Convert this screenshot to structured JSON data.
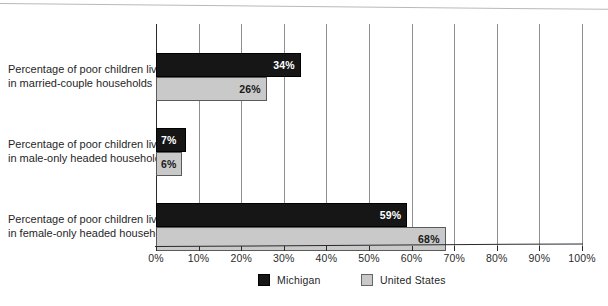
{
  "chart_data": {
    "type": "bar",
    "orientation": "horizontal",
    "title": "",
    "xlabel": "",
    "ylabel": "",
    "xlim": [
      0,
      100
    ],
    "grid": true,
    "legend_position": "bottom",
    "categories": [
      "Percentage of poor children living in married-couple households",
      "Percentage of poor children living in male-only headed households",
      "Percentage of poor children living in female-only headed households"
    ],
    "category_lines": [
      [
        "Percentage of poor children living",
        "in married-couple households"
      ],
      [
        "Percentage of poor children living",
        "in male-only headed households"
      ],
      [
        "Percentage of poor children living",
        "in female-only headed households"
      ]
    ],
    "series": [
      {
        "name": "Michigan",
        "color": "#161616",
        "values": [
          34,
          7,
          59
        ],
        "labels": [
          "34%",
          "7%",
          "59%"
        ]
      },
      {
        "name": "United States",
        "color": "#c9c9c9",
        "values": [
          26,
          6,
          68
        ],
        "labels": [
          "26%",
          "6%",
          "68%"
        ]
      }
    ],
    "tick_values": [
      0,
      10,
      20,
      30,
      40,
      50,
      60,
      70,
      80,
      90,
      100
    ],
    "tick_labels": [
      "0%",
      "10%",
      "20%",
      "30%",
      "40%",
      "50%",
      "60%",
      "70%",
      "80%",
      "90%",
      "100%"
    ]
  },
  "legend": {
    "items": [
      {
        "label": "Michigan",
        "swatch": "michigan"
      },
      {
        "label": "United States",
        "swatch": "us"
      }
    ]
  }
}
